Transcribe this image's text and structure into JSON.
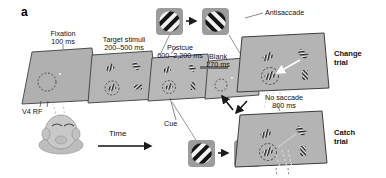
{
  "figure": {
    "panel_letter": "a",
    "type": "experimental-paradigm-diagram"
  },
  "timeline": {
    "axis_label": "Time",
    "epochs": [
      {
        "name": "Fixation",
        "duration": "100 ms"
      },
      {
        "name": "Target stimuli",
        "duration": "200–500 ms"
      },
      {
        "name": "Postcue",
        "duration": "600–2,200 ms"
      },
      {
        "name": "Blank",
        "duration": "270 ms"
      }
    ]
  },
  "annotations": {
    "rf_label": "V4 RF",
    "cue_label": "Cue",
    "antisaccade_label": "Antisaccade",
    "no_saccade_label": "No saccade",
    "no_saccade_duration": "800 ms"
  },
  "outcomes": [
    {
      "name": "Change",
      "sub": "trial"
    },
    {
      "name": "Catch",
      "sub": "trial"
    }
  ],
  "colors": {
    "screen_fill": "#b2b2b2",
    "screen_fill_light": "#bdbdbd",
    "screen_stroke": "#3a3a3a",
    "inset_fill": "#9a9a9a",
    "grating_dark": "#141414",
    "grating_light": "#f2f2f2",
    "head_fill": "#c9c9c9",
    "text": "#111111",
    "arrow": "#1a1a1a",
    "dashed": "#4a4a4a"
  }
}
